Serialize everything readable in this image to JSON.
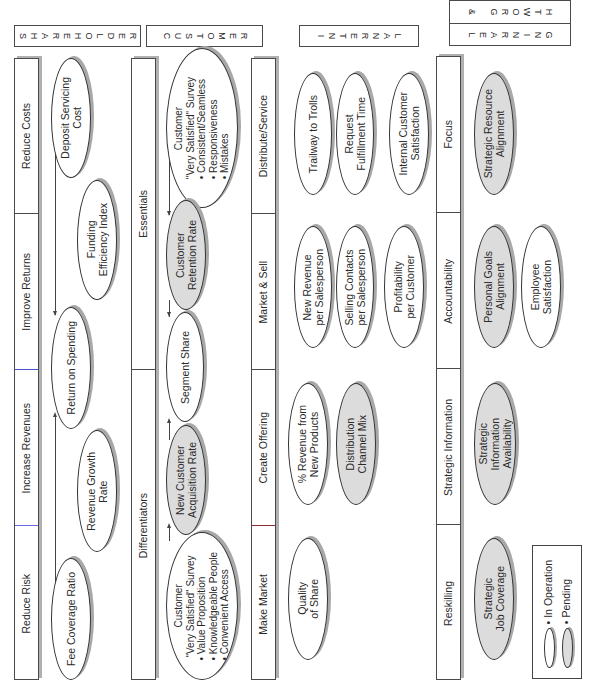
{
  "perspectives": {
    "shareholder": {
      "label": "SHAREHOLDER"
    },
    "customer": {
      "label": "CUSTOMER"
    },
    "internal": {
      "label": "INTERNAL"
    },
    "learning_growth": {
      "label_top": "& GROWTH",
      "label_bottom": "LEARNING"
    }
  },
  "shareholder": {
    "themes": [
      "Reduce Costs",
      "Improve Returns",
      "Increase Revenues",
      "Reduce Risk"
    ],
    "measures": [
      {
        "id": "deposit_servicing_cost",
        "lines": [
          "Deposit Servicing",
          "Cost"
        ],
        "status": "in_operation"
      },
      {
        "id": "funding_efficiency_index",
        "lines": [
          "Funding",
          "Efficiency Index"
        ],
        "status": "in_operation"
      },
      {
        "id": "return_on_spending",
        "lines": [
          "Return on Spending"
        ],
        "status": "in_operation"
      },
      {
        "id": "revenue_growth_rate",
        "lines": [
          "Revenue Growth",
          "Rate"
        ],
        "status": "in_operation"
      },
      {
        "id": "fee_coverage_ratio",
        "lines": [
          "Fee Coverage Ratio"
        ],
        "status": "in_operation"
      }
    ]
  },
  "customer": {
    "themes": [
      "Essentials",
      "Differentiators"
    ],
    "measures": [
      {
        "id": "very_satisfied_survey_essentials",
        "lines": [
          "Customer",
          "\"Very Satisfied\" Survey",
          "• Consistent/Seamless",
          "• Responsiveness",
          "• Mistakes"
        ],
        "status": "in_operation"
      },
      {
        "id": "customer_retention_rate",
        "lines": [
          "Customer",
          "Retention Rate"
        ],
        "status": "pending"
      },
      {
        "id": "segment_share",
        "lines": [
          "Segment Share"
        ],
        "status": "in_operation"
      },
      {
        "id": "new_customer_acquisition_rate",
        "lines": [
          "New Customer",
          "Acquisition Rate"
        ],
        "status": "pending"
      },
      {
        "id": "very_satisfied_survey_differentiators",
        "lines": [
          "Customer",
          "\"Very Satisfied\" Survey",
          "• Value Proposition",
          "• Knowledgeable People",
          "• Convenient Access"
        ],
        "status": "in_operation"
      }
    ]
  },
  "internal": {
    "themes": [
      "Distribute/Service",
      "Market & Sell",
      "Create Offering",
      "Make Market"
    ],
    "measures": [
      {
        "id": "trailway_to_trolls",
        "lines": [
          "Trailway to Trolls"
        ],
        "status": "in_operation"
      },
      {
        "id": "request_fulfillment_time",
        "lines": [
          "Request",
          "Fulfillment Time"
        ],
        "status": "in_operation"
      },
      {
        "id": "internal_customer_satisfaction",
        "lines": [
          "Internal Customer",
          "Satisfaction"
        ],
        "status": "in_operation"
      },
      {
        "id": "new_revenue_per_salesperson",
        "lines": [
          "New Revenue",
          "per Salesperson"
        ],
        "status": "in_operation"
      },
      {
        "id": "selling_contacts_per_salesperson",
        "lines": [
          "Selling Contacts",
          "per Salesperson"
        ],
        "status": "in_operation"
      },
      {
        "id": "profitability_per_customer",
        "lines": [
          "Profitability",
          "per Customer"
        ],
        "status": "in_operation"
      },
      {
        "id": "pct_revenue_new_products",
        "lines": [
          "% Revenue from",
          "New Products"
        ],
        "status": "in_operation"
      },
      {
        "id": "distribution_channel_mix",
        "lines": [
          "Distribution",
          "Channel Mix"
        ],
        "status": "pending"
      },
      {
        "id": "quality_of_share",
        "lines": [
          "Quality",
          "of Share"
        ],
        "status": "in_operation"
      }
    ]
  },
  "learning_growth": {
    "themes": [
      "Focus",
      "Accountability",
      "Strategic Information",
      "Reskilling"
    ],
    "measures": [
      {
        "id": "strategic_resource_alignment",
        "lines": [
          "Strategic Resource",
          "Alignment"
        ],
        "status": "pending"
      },
      {
        "id": "personal_goals_alignment",
        "lines": [
          "Personal Goals",
          "Alignment"
        ],
        "status": "pending"
      },
      {
        "id": "employee_satisfaction",
        "lines": [
          "Employee",
          "Satisfaction"
        ],
        "status": "in_operation"
      },
      {
        "id": "strategic_information_availability",
        "lines": [
          "Strategic",
          "Information",
          "Availability"
        ],
        "status": "pending"
      },
      {
        "id": "strategic_job_coverage",
        "lines": [
          "Strategic",
          "Job Coverage"
        ],
        "status": "pending"
      }
    ]
  },
  "legend": {
    "in_operation": "• In Operation",
    "pending": "• Pending"
  },
  "colors": {
    "in_operation_fill": "#ffffff",
    "pending_fill": "#dcdcdc",
    "stroke": "#333333",
    "shadow": "#a8a8a8"
  }
}
